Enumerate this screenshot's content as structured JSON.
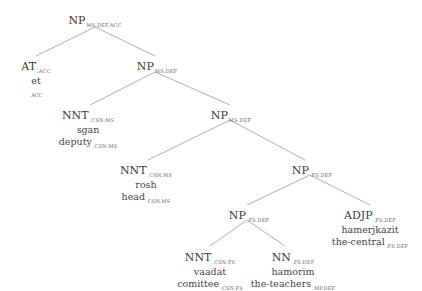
{
  "tree": {
    "nodes": [
      {
        "id": "root",
        "label": "NP",
        "sub": "MS.DEF.ACC"
      },
      {
        "id": "at",
        "label": "AT",
        "sub": ".ACC",
        "word": "et",
        "gloss": "",
        "gloss_sub": ".ACC"
      },
      {
        "id": "np1",
        "label": "NP",
        "sub": "MS.DEF"
      },
      {
        "id": "nnt1",
        "label": "NNT",
        "sub": ".CSN.MS",
        "word": "sgan",
        "gloss": "deputy",
        "gloss_sub": ".CSN.MS"
      },
      {
        "id": "np2",
        "label": "NP",
        "sub": "MS.DEF"
      },
      {
        "id": "nnt2",
        "label": "NNT",
        "sub": ".CSN.MS",
        "word": "rosh",
        "gloss": "head",
        "gloss_sub": ".CSN.MS"
      },
      {
        "id": "np3",
        "label": "NP",
        "sub": ".FS.DEF"
      },
      {
        "id": "np4",
        "label": "NP",
        "sub": ".FS.DEF"
      },
      {
        "id": "adjp",
        "label": "ADJP",
        "sub": ".FS.DEF",
        "word": "hamerjkazit",
        "gloss": "the-central",
        "gloss_sub": ".FS.DEF"
      },
      {
        "id": "nnt3",
        "label": "NNT",
        "sub": ".CSN.FS",
        "word": "vaadat",
        "gloss": "comittee",
        "gloss_sub": ".CSN.FS"
      },
      {
        "id": "nn",
        "label": "NN",
        "sub": ".FS.DEF",
        "word": "hamorim",
        "gloss": "the-teachers",
        "gloss_sub": ".MP.DEF"
      }
    ],
    "edges": [
      [
        "root",
        "at"
      ],
      [
        "root",
        "np1"
      ],
      [
        "np1",
        "nnt1"
      ],
      [
        "np1",
        "np2"
      ],
      [
        "np2",
        "nnt2"
      ],
      [
        "np2",
        "np3"
      ],
      [
        "np3",
        "np4"
      ],
      [
        "np3",
        "adjp"
      ],
      [
        "np4",
        "nnt3"
      ],
      [
        "np4",
        "nn"
      ]
    ]
  }
}
